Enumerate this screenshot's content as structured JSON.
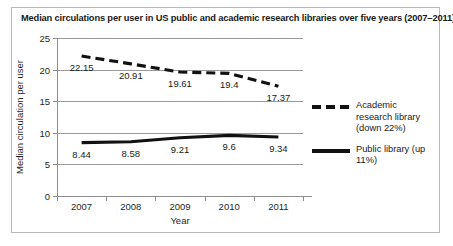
{
  "chart_data": {
    "type": "line",
    "title": "Median circulations per user in US public and academic research libraries over five years (2007–2011)",
    "xlabel": "Year",
    "ylabel": "Median circulation per user",
    "categories": [
      "2007",
      "2008",
      "2009",
      "2010",
      "2011"
    ],
    "ylim": [
      0,
      25
    ],
    "yticks": [
      0,
      5,
      10,
      15,
      20,
      25
    ],
    "ytick_labels": [
      "0",
      "5",
      "10",
      "15",
      "20",
      "25"
    ],
    "grid": true,
    "legend_position": "right",
    "series": [
      {
        "name": "Academic research library (down 22%)",
        "style": "dashed",
        "color": "#111111",
        "values": [
          22.15,
          20.91,
          19.61,
          19.4,
          17.37
        ],
        "labels": [
          "22.15",
          "20.91",
          "19.61",
          "19.4",
          "17.37"
        ]
      },
      {
        "name": "Public library (up 11%)",
        "style": "solid",
        "color": "#111111",
        "values": [
          8.44,
          8.58,
          9.21,
          9.6,
          9.34
        ],
        "labels": [
          "8.44",
          "8.58",
          "9.21",
          "9.6",
          "9.34"
        ]
      }
    ]
  },
  "legend": {
    "items": [
      {
        "label": "Academic research library (down 22%)",
        "style": "dashed"
      },
      {
        "label": "Public library (up 11%)",
        "style": "solid"
      }
    ]
  }
}
